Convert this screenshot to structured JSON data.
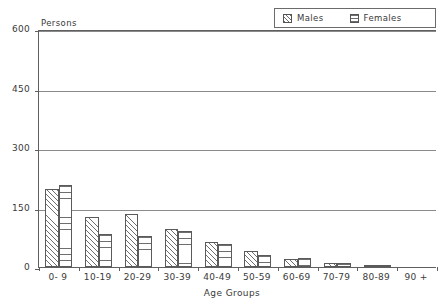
{
  "chart_data": {
    "type": "bar",
    "title": "",
    "ylabel": "Persons",
    "xlabel": "Age Groups",
    "categories": [
      "0- 9",
      "10-19",
      "20-29",
      "30-39",
      "40-49",
      "50-59",
      "60-69",
      "70-79",
      "80-89",
      "90 +"
    ],
    "series": [
      {
        "name": "Males",
        "values": [
          196,
          127,
          134,
          97,
          62,
          41,
          20,
          9,
          4,
          0
        ]
      },
      {
        "name": "Females",
        "values": [
          208,
          83,
          78,
          92,
          57,
          30,
          22,
          10,
          3,
          0
        ]
      }
    ],
    "ylim": [
      0,
      600
    ],
    "yticks": [
      0,
      150,
      300,
      450,
      600
    ],
    "ytick_labels": [
      "0",
      "150",
      "300",
      "450",
      "600"
    ],
    "grid": true,
    "legend_position": "top-right",
    "colors": {
      "axis": "#5f5f5f",
      "grid": "#8a8a8a",
      "bar_outline": "#5a5a5a",
      "hatch": "#6e6e6e",
      "text": "#3a3a3a",
      "background": "#ffffff"
    }
  },
  "legend": {
    "entries": [
      {
        "label": "Males",
        "pattern": "diagonal-hatch-icon"
      },
      {
        "label": "Females",
        "pattern": "horizontal-lines-icon"
      }
    ]
  },
  "axes": {
    "y_note": "Persons",
    "x_title": "Age Groups"
  }
}
